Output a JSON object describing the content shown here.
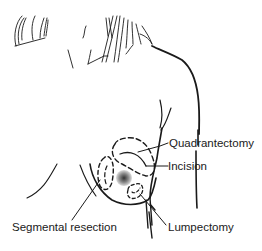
{
  "diagram": {
    "colors": {
      "ink": "#1a1a1a",
      "background": "#ffffff",
      "nipple": "#777777"
    },
    "labels": [
      {
        "id": "quadrantectomy",
        "text": "Quadrantectomy"
      },
      {
        "id": "incision",
        "text": "Incision"
      },
      {
        "id": "segmental-resection",
        "text": "Segmental resection"
      },
      {
        "id": "lumpectomy",
        "text": "Lumpectomy"
      }
    ]
  }
}
